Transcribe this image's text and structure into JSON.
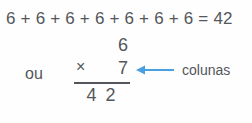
{
  "figure": {
    "background_color": "#fefefe",
    "text_color": "#53565a",
    "accent_color": "#4a9fe0"
  },
  "addition": {
    "expression": "6 + 6 + 6 + 6 + 6 + 6 + 6 = 42",
    "addend": "6",
    "addend_count": 7,
    "sum": "42"
  },
  "connector": {
    "word": "ou"
  },
  "multiplication": {
    "multiplicand": "6",
    "operator": "×",
    "multiplier": "7",
    "product": "4 2"
  },
  "annotation": {
    "label": "colunas",
    "arrow_icon": "arrow-left-icon",
    "arrow_color": "#4a9fe0",
    "direction": "left"
  }
}
